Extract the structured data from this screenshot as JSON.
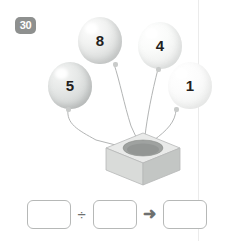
{
  "exercise": {
    "number": "30"
  },
  "scene": {
    "description": "four numbered balloons tied by strings into a box",
    "balloons": [
      {
        "id": "balloon-8",
        "number": "8",
        "shade": "#dddfde"
      },
      {
        "id": "balloon-4",
        "number": "4",
        "shade": "#eff0ef"
      },
      {
        "id": "balloon-5",
        "number": "5",
        "shade": "#d5d8d7"
      },
      {
        "id": "balloon-1",
        "number": "1",
        "shade": "#f4f5f4"
      }
    ],
    "box": {
      "name": "box",
      "top_color": "#e9eae9",
      "front_color": "#d9dbd9",
      "side_color": "#c3c6c4",
      "hole_color": "#9fa2a0"
    },
    "string_color": "#a9acab"
  },
  "equation": {
    "operand1": "",
    "operand1_placeholder": "",
    "operator": "÷",
    "operand2": "",
    "operand2_placeholder": "",
    "arrow": "➜",
    "result": "",
    "result_placeholder": ""
  },
  "colors": {
    "guide_line": "#ebebeb",
    "badge_bg": "#8e908f",
    "badge_text": "#ffffff",
    "box_border": "#b6b8b7",
    "number_text": "#231f20"
  }
}
